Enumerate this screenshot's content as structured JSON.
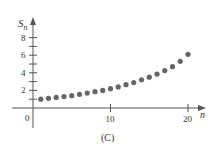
{
  "chart_data": {
    "type": "scatter",
    "title": "",
    "caption": "(C)",
    "xlabel": "n",
    "ylabel": "S_n",
    "x": [
      1,
      2,
      3,
      4,
      5,
      6,
      7,
      8,
      9,
      10,
      11,
      12,
      13,
      14,
      15,
      16,
      17,
      18,
      19,
      20
    ],
    "values": [
      1.0,
      1.1,
      1.2,
      1.3,
      1.4,
      1.55,
      1.7,
      1.85,
      2.0,
      2.2,
      2.4,
      2.65,
      2.9,
      3.2,
      3.5,
      3.85,
      4.25,
      4.7,
      5.3,
      6.1
    ],
    "x_ticks": [
      0,
      10,
      20
    ],
    "y_ticks": [
      2,
      4,
      6,
      8
    ],
    "y_minor_ticks": [
      1,
      3,
      5,
      7
    ],
    "xlim": [
      0,
      21
    ],
    "ylim": [
      0,
      9
    ],
    "grid": false,
    "marker_color": "#666666"
  },
  "labels": {
    "ylabel_main": "S",
    "ylabel_sub": "n",
    "xlabel": "n",
    "origin": "0",
    "caption": "(C)"
  }
}
